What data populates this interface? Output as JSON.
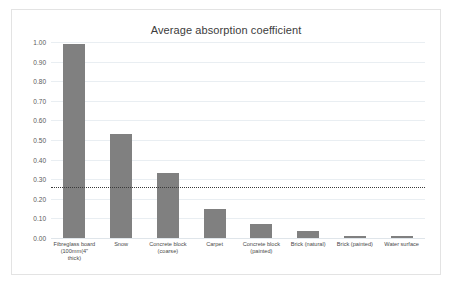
{
  "chart_data": {
    "type": "bar",
    "title": "Average absorption coefficient",
    "xlabel": "",
    "ylabel": "",
    "ylim": [
      0.0,
      1.0
    ],
    "ytick_labels": [
      "1.00",
      "0.90",
      "0.80",
      "0.70",
      "0.60",
      "0.50",
      "0.40",
      "0.30",
      "0.20",
      "0.10",
      "0.00"
    ],
    "ytick_values": [
      1.0,
      0.9,
      0.8,
      0.7,
      0.6,
      0.5,
      0.4,
      0.3,
      0.2,
      0.1,
      0.0
    ],
    "grid": true,
    "legend": "none",
    "bar_color": "#808080",
    "categories": [
      "Fibreglass board\n(100mm(4\"\n thick)",
      "Snow",
      "Concrete block\n(coarse)",
      "Carpet",
      "Concrete block\n(painted)",
      "Brick (natural)",
      "Brick (painted)",
      "Water surface"
    ],
    "values": [
      0.99,
      0.53,
      0.33,
      0.15,
      0.07,
      0.035,
      0.012,
      0.01
    ],
    "annotations": [
      {
        "name": "average-reference-line",
        "type": "horizontal-dotted-line",
        "value": 0.26,
        "color": "#3a3a3a"
      }
    ]
  }
}
